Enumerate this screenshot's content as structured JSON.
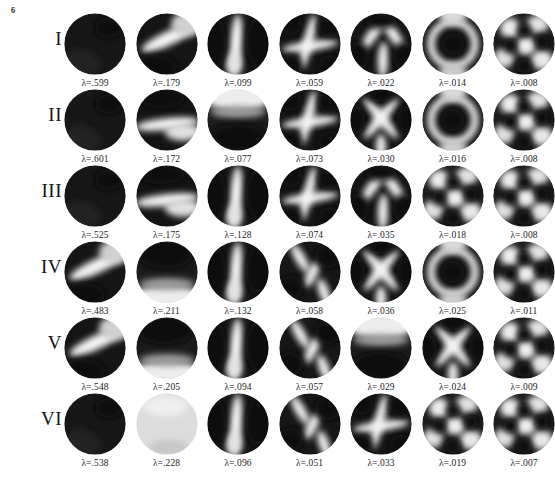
{
  "figure": {
    "page_number": "6",
    "lambda_symbol": "λ",
    "eigenvalue_prefix": "λ=",
    "background_color": "#ffffff",
    "text_color": "#1c1c1c",
    "rows": [
      {
        "label": "I",
        "cells": [
          {
            "eigenvalue": "λ=.599",
            "value": 0.599,
            "mode": "disc-uniform-dark"
          },
          {
            "eigenvalue": "λ=.179",
            "value": 0.179,
            "mode": "disc-diagonal-band"
          },
          {
            "eigenvalue": "λ=.099",
            "value": 0.099,
            "mode": "disc-vertical-band"
          },
          {
            "eigenvalue": "λ=.059",
            "value": 0.059,
            "mode": "disc-cross"
          },
          {
            "eigenvalue": "λ=.022",
            "value": 0.022,
            "mode": "disc-y-junction"
          },
          {
            "eigenvalue": "λ=.014",
            "value": 0.014,
            "mode": "disc-ring-lobes"
          },
          {
            "eigenvalue": "λ=.008",
            "value": 0.008,
            "mode": "disc-multi-lobe"
          }
        ]
      },
      {
        "label": "II",
        "cells": [
          {
            "eigenvalue": "λ=.601",
            "value": 0.601,
            "mode": "disc-uniform-dark"
          },
          {
            "eigenvalue": "λ=.172",
            "value": 0.172,
            "mode": "disc-horizontal-band"
          },
          {
            "eigenvalue": "λ=.077",
            "value": 0.077,
            "mode": "disc-light-top"
          },
          {
            "eigenvalue": "λ=.073",
            "value": 0.073,
            "mode": "disc-cross"
          },
          {
            "eigenvalue": "λ=.030",
            "value": 0.03,
            "mode": "disc-x-junction"
          },
          {
            "eigenvalue": "λ=.016",
            "value": 0.016,
            "mode": "disc-ring-lobes"
          },
          {
            "eigenvalue": "λ=.008",
            "value": 0.008,
            "mode": "disc-multi-lobe"
          }
        ]
      },
      {
        "label": "III",
        "cells": [
          {
            "eigenvalue": "λ=.525",
            "value": 0.525,
            "mode": "disc-uniform-dark"
          },
          {
            "eigenvalue": "λ=.175",
            "value": 0.175,
            "mode": "disc-horizontal-band"
          },
          {
            "eigenvalue": "λ=.128",
            "value": 0.128,
            "mode": "disc-vertical-band"
          },
          {
            "eigenvalue": "λ=.074",
            "value": 0.074,
            "mode": "disc-cross"
          },
          {
            "eigenvalue": "λ=.035",
            "value": 0.035,
            "mode": "disc-y-junction"
          },
          {
            "eigenvalue": "λ=.018",
            "value": 0.018,
            "mode": "disc-multi-lobe"
          },
          {
            "eigenvalue": "λ=.008",
            "value": 0.008,
            "mode": "disc-multi-lobe"
          }
        ]
      },
      {
        "label": "IV",
        "cells": [
          {
            "eigenvalue": "λ=.483",
            "value": 0.483,
            "mode": "disc-diagonal-band"
          },
          {
            "eigenvalue": "λ=.211",
            "value": 0.211,
            "mode": "disc-light-bottom"
          },
          {
            "eigenvalue": "λ=.132",
            "value": 0.132,
            "mode": "disc-vertical-band"
          },
          {
            "eigenvalue": "λ=.058",
            "value": 0.058,
            "mode": "disc-s-curve"
          },
          {
            "eigenvalue": "λ=.036",
            "value": 0.036,
            "mode": "disc-x-junction"
          },
          {
            "eigenvalue": "λ=.025",
            "value": 0.025,
            "mode": "disc-ring-lobes"
          },
          {
            "eigenvalue": "λ=.011",
            "value": 0.011,
            "mode": "disc-multi-lobe"
          }
        ]
      },
      {
        "label": "V",
        "cells": [
          {
            "eigenvalue": "λ=.548",
            "value": 0.548,
            "mode": "disc-diagonal-band"
          },
          {
            "eigenvalue": "λ=.205",
            "value": 0.205,
            "mode": "disc-light-bottom"
          },
          {
            "eigenvalue": "λ=.094",
            "value": 0.094,
            "mode": "disc-vertical-band"
          },
          {
            "eigenvalue": "λ=.057",
            "value": 0.057,
            "mode": "disc-s-curve"
          },
          {
            "eigenvalue": "λ=.029",
            "value": 0.029,
            "mode": "disc-light-top"
          },
          {
            "eigenvalue": "λ=.024",
            "value": 0.024,
            "mode": "disc-x-junction"
          },
          {
            "eigenvalue": "λ=.009",
            "value": 0.009,
            "mode": "disc-multi-lobe"
          }
        ]
      },
      {
        "label": "VI",
        "cells": [
          {
            "eigenvalue": "λ=.538",
            "value": 0.538,
            "mode": "disc-uniform-dark"
          },
          {
            "eigenvalue": "λ=.228",
            "value": 0.228,
            "mode": "disc-uniform-light"
          },
          {
            "eigenvalue": "λ=.096",
            "value": 0.096,
            "mode": "disc-vertical-band"
          },
          {
            "eigenvalue": "λ=.051",
            "value": 0.051,
            "mode": "disc-s-curve"
          },
          {
            "eigenvalue": "λ=.033",
            "value": 0.033,
            "mode": "disc-cross"
          },
          {
            "eigenvalue": "λ=.019",
            "value": 0.019,
            "mode": "disc-multi-lobe"
          },
          {
            "eigenvalue": "λ=.007",
            "value": 0.007,
            "mode": "disc-multi-lobe"
          }
        ]
      }
    ]
  },
  "chart_data": {
    "type": "heatmap",
    "title": "",
    "rows": [
      "I",
      "II",
      "III",
      "IV",
      "V",
      "VI"
    ],
    "columns": [
      1,
      2,
      3,
      4,
      5,
      6,
      7
    ],
    "series": [
      {
        "name": "I",
        "values": [
          0.599,
          0.179,
          0.099,
          0.059,
          0.022,
          0.014,
          0.008
        ]
      },
      {
        "name": "II",
        "values": [
          0.601,
          0.172,
          0.077,
          0.073,
          0.03,
          0.016,
          0.008
        ]
      },
      {
        "name": "III",
        "values": [
          0.525,
          0.175,
          0.128,
          0.074,
          0.035,
          0.018,
          0.008
        ]
      },
      {
        "name": "IV",
        "values": [
          0.483,
          0.211,
          0.132,
          0.058,
          0.036,
          0.025,
          0.011
        ]
      },
      {
        "name": "V",
        "values": [
          0.548,
          0.205,
          0.094,
          0.057,
          0.029,
          0.024,
          0.009
        ]
      },
      {
        "name": "VI",
        "values": [
          0.538,
          0.228,
          0.096,
          0.051,
          0.033,
          0.019,
          0.007
        ]
      }
    ],
    "xlabel": "",
    "ylabel": "",
    "grid": false,
    "legend": "none"
  }
}
